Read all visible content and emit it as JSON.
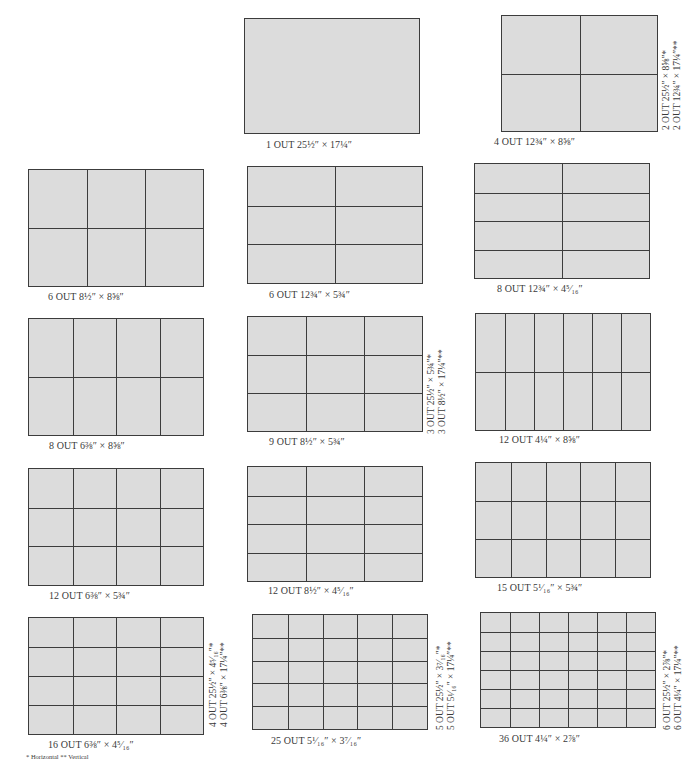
{
  "diagrams": [
    {
      "id": "d1",
      "caption": "1 OUT 25½″ × 17¼″",
      "cols": 1,
      "rows": 1,
      "side": []
    },
    {
      "id": "d2",
      "caption": "4 OUT 12¾″ × 8⅝″",
      "cols": 2,
      "rows": 2,
      "side": [
        "2 OUT 25½″ × 8⅝″*",
        "2 OUT 12¾″ × 17¼″**"
      ]
    },
    {
      "id": "d3",
      "caption": "6 OUT 8½″ × 8⅝″",
      "cols": 3,
      "rows": 2,
      "side": []
    },
    {
      "id": "d4",
      "caption": "6 OUT 12¾″ × 5¾″",
      "cols": 2,
      "rows": 3,
      "side": []
    },
    {
      "id": "d5",
      "caption": "8 OUT 12¾″ × 4⁵⁄₁₆″",
      "cols": 2,
      "rows": 4,
      "side": []
    },
    {
      "id": "d6",
      "caption": "8 OUT 6⅜″ × 8⅝″",
      "cols": 4,
      "rows": 2,
      "side": []
    },
    {
      "id": "d7",
      "caption": "9 OUT 8½″ × 5¾″",
      "cols": 3,
      "rows": 3,
      "side": [
        "3 OUT 25½″ × 5¾″*",
        "3 OUT 8½″ × 17¼″**"
      ]
    },
    {
      "id": "d8",
      "caption": "12 OUT 4¼″ × 8⅝″",
      "cols": 6,
      "rows": 2,
      "side": []
    },
    {
      "id": "d9",
      "caption": "12 OUT 6⅜″ × 5¾″",
      "cols": 4,
      "rows": 3,
      "side": []
    },
    {
      "id": "d10",
      "caption": "12 OUT 8½″ × 4⁵⁄₁₆″",
      "cols": 3,
      "rows": 4,
      "side": []
    },
    {
      "id": "d11",
      "caption": "15 OUT 5¹⁄₁₆″ × 5¾″",
      "cols": 5,
      "rows": 3,
      "side": []
    },
    {
      "id": "d12",
      "caption": "16 OUT 6⅜″ × 4⁵⁄₁₆″",
      "cols": 4,
      "rows": 4,
      "side": [
        "4 OUT 25½″ × 4⁵⁄₁₆″*",
        "4 OUT 6⅜″ × 17¼″**"
      ]
    },
    {
      "id": "d13",
      "caption": "25 OUT 5¹⁄₁₆″ × 3⁷⁄₁₆″",
      "cols": 5,
      "rows": 5,
      "side": [
        "5 OUT 25½″ × 3⁷⁄₁₆″*",
        "5 OUT 5¹⁄₁₆″ × 17¼″**"
      ]
    },
    {
      "id": "d14",
      "caption": "36 OUT 4¼″ × 2⅞″",
      "cols": 6,
      "rows": 6,
      "side": [
        "6 OUT 25½″ × 2⅞″*",
        "6 OUT 4¼″ × 17¼″**"
      ]
    }
  ],
  "footnote": "* Horizontal   ** Vertical",
  "colors": {
    "sheet_fill": "#dcdcdc",
    "line": "#3c3c3c",
    "text": "#3a3a3a"
  }
}
